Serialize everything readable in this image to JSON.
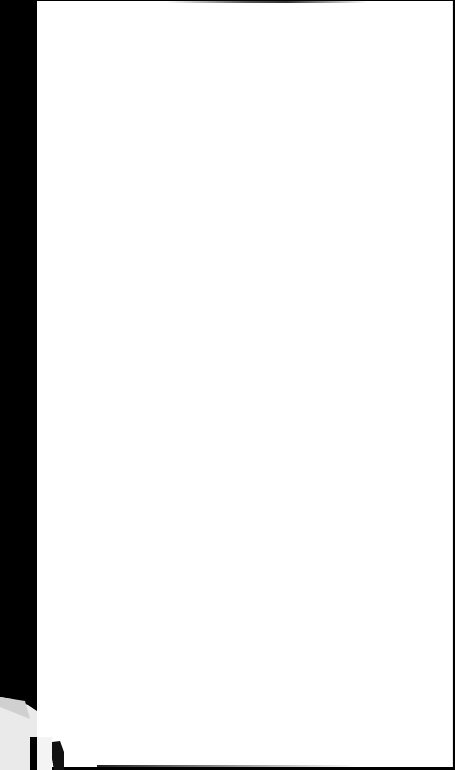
{
  "document": {
    "type": "blank-scanned-page",
    "text": "",
    "colors": {
      "background": "#000000",
      "page": "#ffffff"
    }
  }
}
